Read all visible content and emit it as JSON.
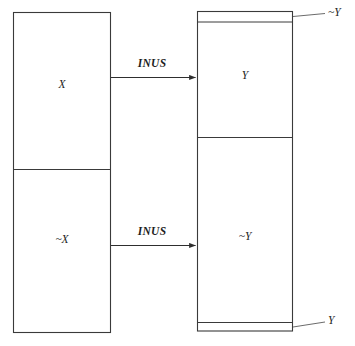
{
  "diagram": {
    "type": "causal-inus-diagram",
    "colors": {
      "stroke": "#3a3a3a",
      "arrow": "#2e2e2e",
      "leader": "#5a5a5a",
      "text": "#1d1d1d",
      "background": "#ffffff"
    },
    "left_box": {
      "name": "antecedent-box",
      "sections": [
        {
          "id": "x-section",
          "label": "X"
        },
        {
          "id": "not-x-section",
          "label": "~X"
        }
      ]
    },
    "right_box": {
      "name": "consequent-box",
      "sections": [
        {
          "id": "top-band",
          "label": ""
        },
        {
          "id": "y-section",
          "label": "Y"
        },
        {
          "id": "not-y-section",
          "label": "~Y"
        },
        {
          "id": "bottom-band",
          "label": ""
        }
      ]
    },
    "arrows": [
      {
        "id": "arrow-x-to-y",
        "label": "INUS"
      },
      {
        "id": "arrow-notx-to-noty",
        "label": "INUS"
      }
    ],
    "callouts": [
      {
        "id": "callout-top",
        "label": "~Y"
      },
      {
        "id": "callout-bottom",
        "label": "Y"
      }
    ]
  }
}
